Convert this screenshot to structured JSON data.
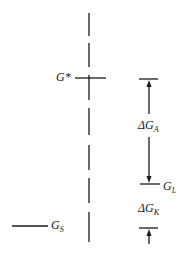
{
  "diagram": {
    "type": "energy-level diagram",
    "labels": {
      "g_star": {
        "main": "G",
        "sup": "*"
      },
      "delta_g_a": {
        "main": "ΔG",
        "sub": "A"
      },
      "g_l": {
        "main": "G",
        "sub": "L"
      },
      "delta_g_k": {
        "main": "ΔG",
        "sub": "K"
      },
      "g_s": {
        "main": "G",
        "sub": "S"
      }
    },
    "colors": {
      "line": "#1a1a1a",
      "background": "#ffffff"
    }
  }
}
